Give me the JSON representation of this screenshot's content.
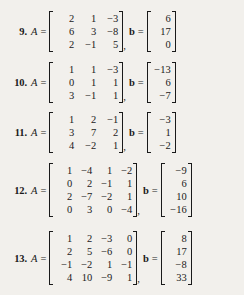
{
  "page": {
    "background_color": "#f2f0ec",
    "text_color": "#1a1a1a",
    "symbols": {
      "A": "A",
      "b": "b",
      "equals": "=",
      "comma": ","
    }
  },
  "exercises": [
    {
      "number": "9.",
      "A": {
        "rows": 3,
        "cols": 3,
        "values": [
          [
            "2",
            "1",
            "−3"
          ],
          [
            "6",
            "3",
            "−8"
          ],
          [
            "2",
            "−1",
            "5"
          ]
        ]
      },
      "b": {
        "rows": 3,
        "cols": 1,
        "values": [
          [
            "6"
          ],
          [
            "17"
          ],
          [
            "0"
          ]
        ]
      }
    },
    {
      "number": "10.",
      "A": {
        "rows": 3,
        "cols": 3,
        "values": [
          [
            "1",
            "1",
            "−3"
          ],
          [
            "0",
            "1",
            "1"
          ],
          [
            "3",
            "−1",
            "1"
          ]
        ]
      },
      "b": {
        "rows": 3,
        "cols": 1,
        "values": [
          [
            "−13"
          ],
          [
            "6"
          ],
          [
            "−7"
          ]
        ]
      }
    },
    {
      "number": "11.",
      "A": {
        "rows": 3,
        "cols": 3,
        "values": [
          [
            "1",
            "2",
            "−1"
          ],
          [
            "3",
            "7",
            "2"
          ],
          [
            "4",
            "−2",
            "1"
          ]
        ]
      },
      "b": {
        "rows": 3,
        "cols": 1,
        "values": [
          [
            "−3"
          ],
          [
            "1"
          ],
          [
            "−2"
          ]
        ]
      }
    },
    {
      "number": "12.",
      "A": {
        "rows": 4,
        "cols": 4,
        "values": [
          [
            "1",
            "−4",
            "1",
            "−2"
          ],
          [
            "0",
            "2",
            "−1",
            "1"
          ],
          [
            "2",
            "−7",
            "−2",
            "1"
          ],
          [
            "0",
            "3",
            "0",
            "−4"
          ]
        ]
      },
      "b": {
        "rows": 4,
        "cols": 1,
        "values": [
          [
            "−9"
          ],
          [
            "6"
          ],
          [
            "10"
          ],
          [
            "−16"
          ]
        ]
      }
    },
    {
      "number": "13.",
      "A": {
        "rows": 4,
        "cols": 4,
        "values": [
          [
            "1",
            "2",
            "−3",
            "0"
          ],
          [
            "2",
            "5",
            "−6",
            "0"
          ],
          [
            "−1",
            "−2",
            "1",
            "−1"
          ],
          [
            "4",
            "10",
            "−9",
            "1"
          ]
        ]
      },
      "b": {
        "rows": 4,
        "cols": 1,
        "values": [
          [
            "8"
          ],
          [
            "17"
          ],
          [
            "−8"
          ],
          [
            "33"
          ]
        ]
      }
    }
  ]
}
